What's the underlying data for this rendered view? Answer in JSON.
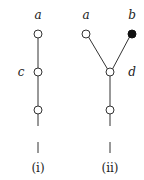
{
  "figure": {
    "trees": [
      {
        "caption": "(i)",
        "labels": {
          "top": "a",
          "middle": "c"
        },
        "nodes": [
          {
            "id": "a",
            "x": 38,
            "y": 34,
            "filled": false
          },
          {
            "id": "c",
            "x": 38,
            "y": 72,
            "filled": false
          },
          {
            "id": "n3",
            "x": 38,
            "y": 110,
            "filled": false
          }
        ]
      },
      {
        "caption": "(ii)",
        "labels": {
          "left": "a",
          "right": "b",
          "junction": "d"
        },
        "nodes": [
          {
            "id": "a",
            "x": 86,
            "y": 34,
            "filled": false
          },
          {
            "id": "b",
            "x": 132,
            "y": 34,
            "filled": true
          },
          {
            "id": "d",
            "x": 110,
            "y": 72,
            "filled": false
          },
          {
            "id": "n4",
            "x": 110,
            "y": 110,
            "filled": false
          }
        ]
      }
    ]
  }
}
